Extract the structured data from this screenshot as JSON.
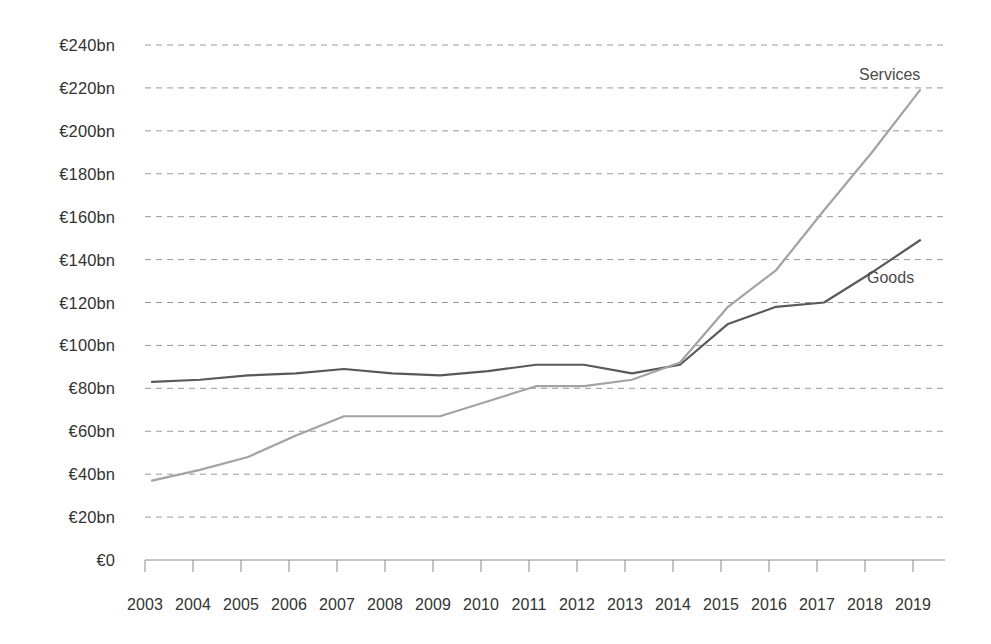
{
  "chart_data": {
    "type": "line",
    "title": "",
    "subtitle": "",
    "xlabel": "",
    "ylabel": "",
    "categories": [
      "2003",
      "2004",
      "2005",
      "2006",
      "2007",
      "2008",
      "2009",
      "2010",
      "2011",
      "2012",
      "2013",
      "2014",
      "2015",
      "2016",
      "2017",
      "2018",
      "2019"
    ],
    "x": [
      2003,
      2004,
      2005,
      2006,
      2007,
      2008,
      2009,
      2010,
      2011,
      2012,
      2013,
      2014,
      2015,
      2016,
      2017,
      2018,
      2019
    ],
    "series": [
      {
        "name": "Goods",
        "color": "#595959",
        "values": [
          83,
          84,
          86,
          87,
          89,
          87,
          86,
          88,
          91,
          91,
          87,
          91,
          110,
          118,
          120,
          134,
          149
        ]
      },
      {
        "name": "Services",
        "color": "#a3a3a3",
        "values": [
          37,
          42,
          48,
          58,
          67,
          67,
          67,
          74,
          81,
          81,
          84,
          92,
          118,
          135,
          163,
          190,
          219
        ]
      }
    ],
    "ylim": [
      0,
      240
    ],
    "ytick_values": [
      0,
      20,
      40,
      60,
      80,
      100,
      120,
      140,
      160,
      180,
      200,
      220,
      240
    ],
    "ytick_labels": [
      "€0",
      "€20bn",
      "€40bn",
      "€60bn",
      "€80bn",
      "€100bn",
      "€120bn",
      "€140bn",
      "€160bn",
      "€180bn",
      "€200bn",
      "€220bn",
      "€240bn"
    ],
    "grid": true,
    "grid_style": "dashed",
    "grid_color": "#999999",
    "axis_color": "#8c8c8c",
    "legend_position": "inline-annotations",
    "annotations": [
      {
        "text": "Services",
        "series": "Services",
        "x": 2018,
        "y": 228
      },
      {
        "text": "Goods",
        "series": "Goods",
        "x": 2017.5,
        "y": 133
      }
    ]
  },
  "axis": {
    "y_labels": [
      "€240bn",
      "€220bn",
      "€200bn",
      "€180bn",
      "€160bn",
      "€140bn",
      "€120bn",
      "€100bn",
      "€80bn",
      "€60bn",
      "€40bn",
      "€20bn",
      "€0"
    ],
    "x_labels": [
      "2003",
      "2004",
      "2005",
      "2006",
      "2007",
      "2008",
      "2009",
      "2010",
      "2011",
      "2012",
      "2013",
      "2014",
      "2015",
      "2016",
      "2017",
      "2018",
      "2019"
    ]
  },
  "labels": {
    "services": "Services",
    "goods": "Goods"
  }
}
